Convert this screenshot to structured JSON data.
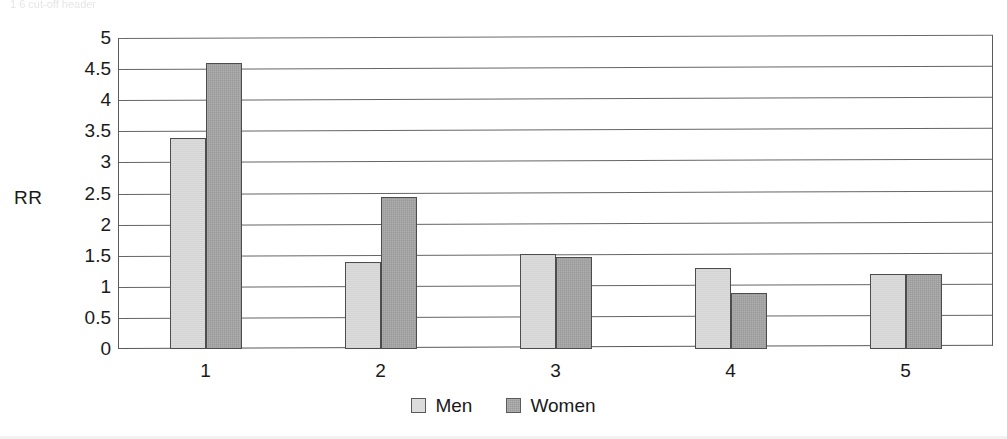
{
  "page": {
    "header_remnant": "1 6    cut-off header"
  },
  "chart_data": {
    "type": "bar",
    "title": "",
    "subtitle": "",
    "xlabel": "",
    "ylabel": "RR",
    "categories": [
      "1",
      "2",
      "3",
      "4",
      "5"
    ],
    "series": [
      {
        "name": "Men",
        "color": "#dcdcdc",
        "values": [
          3.4,
          1.4,
          1.53,
          1.3,
          1.2
        ]
      },
      {
        "name": "Women",
        "color": "#9a9a9a",
        "values": [
          4.6,
          2.45,
          1.48,
          0.9,
          1.2
        ]
      }
    ],
    "ylim": [
      0,
      5
    ],
    "ytick_step": 0.5,
    "yticks": [
      "5",
      "4.5",
      "4",
      "3.5",
      "3",
      "2.5",
      "2",
      "1.5",
      "1",
      "0.5",
      "0"
    ],
    "ytick_values": [
      5,
      4.5,
      4,
      3.5,
      3,
      2.5,
      2,
      1.5,
      1,
      0.5,
      0
    ],
    "grid": true,
    "grid_axis": "y",
    "legend_position": "bottom",
    "legend_entries": [
      "Men",
      "Women"
    ],
    "annotations": []
  },
  "colors": {
    "men_fill": "#dcdcdc",
    "women_fill": "#9a9a9a",
    "bar_border": "#4d4d4d",
    "gridline": "#666666",
    "frame": "#5a5a5a",
    "text": "#1a1a1a",
    "background": "#ffffff"
  }
}
